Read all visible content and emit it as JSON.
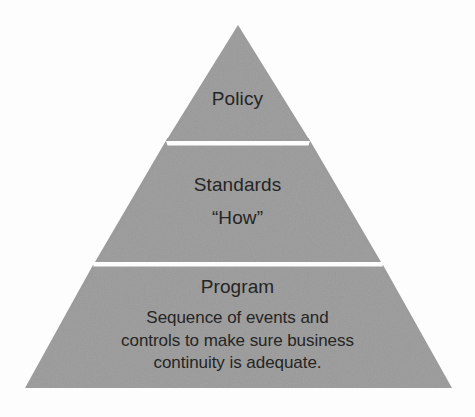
{
  "diagram": {
    "type": "pyramid",
    "colors": {
      "fill": "#9b9b9b",
      "divider": "#ffffff",
      "text": "#252525",
      "background": "#fdfdfd"
    },
    "geometry": {
      "apex_x": 238,
      "apex_y": 25,
      "base_left_x": 25,
      "base_right_x": 452,
      "base_y": 388,
      "divider_1_y": 144,
      "divider_2_y": 265
    },
    "tiers": [
      {
        "level": 1,
        "name": "policy",
        "title": "Policy",
        "subtitle": "",
        "body_lines": []
      },
      {
        "level": 2,
        "name": "standards",
        "title": "Standards",
        "subtitle": "“How”",
        "body_lines": []
      },
      {
        "level": 3,
        "name": "program",
        "title": "Program",
        "subtitle": "",
        "body_lines": [
          "Sequence of events and",
          "controls to make sure business",
          "continuity is adequate."
        ]
      }
    ]
  }
}
